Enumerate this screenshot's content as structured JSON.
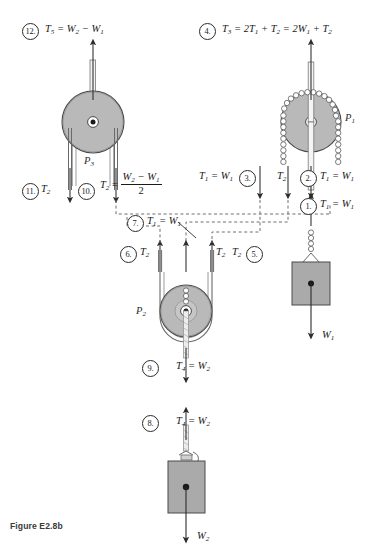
{
  "figure": {
    "caption": "Figure E2.8b"
  },
  "pulleys": [
    {
      "id": "p1",
      "label_base": "P",
      "label_sub": "1",
      "x": 311,
      "y": 122,
      "r": 30
    },
    {
      "id": "p2",
      "label_base": "P",
      "label_sub": "2",
      "x": 186,
      "y": 311,
      "r": 26
    },
    {
      "id": "p3",
      "label_base": "P",
      "label_sub": "3",
      "x": 93,
      "y": 122,
      "r": 31
    }
  ],
  "weights": [
    {
      "id": "w1",
      "label_base": "W",
      "label_sub": "1",
      "x": 311,
      "y": 292
    },
    {
      "id": "w2",
      "label_base": "W",
      "label_sub": "2",
      "x": 186,
      "y": 483
    }
  ],
  "annotations": [
    {
      "n": "1.",
      "text_html": "T<sub>1</sub> = W<sub>1</sub>",
      "plain": "T1 = W1",
      "arrow": "up",
      "num_x": 300,
      "num_y": 198,
      "lbl_x": 320,
      "lbl_y": 199
    },
    {
      "n": "2.",
      "text_html": "T<sub>1</sub> = W<sub>1</sub>",
      "plain": "T1 = W1",
      "arrow": "down",
      "num_x": 300,
      "num_y": 170,
      "lbl_x": 320,
      "lbl_y": 171
    },
    {
      "n": "3.",
      "text_html": "T<sub>1</sub> = W<sub>1</sub>",
      "plain": "T1 = W1",
      "arrow": "down",
      "num_x": 239,
      "num_y": 170,
      "lbl_x": 199,
      "lbl_y": 171
    },
    {
      "n": "4.",
      "text_html": "T<sub>3</sub> = 2T<sub>1</sub> + T<sub>2</sub> = 2W<sub>1</sub> + T<sub>2</sub>",
      "plain": "T3 = 2T1 + T2 = 2W1 + T2",
      "arrow": "up",
      "num_x": 199,
      "num_y": 23,
      "lbl_x": 222,
      "lbl_y": 24
    },
    {
      "n": "5.",
      "text_html": "T<sub>2</sub>",
      "plain": "T2",
      "arrow": "up",
      "num_x": 246,
      "num_y": 246,
      "lbl_x": 232,
      "lbl_y": 247
    },
    {
      "n": "6.",
      "text_html": "T<sub>2</sub>",
      "plain": "T2",
      "arrow": "up",
      "num_x": 120,
      "num_y": 246,
      "lbl_x": 140,
      "lbl_y": 247
    },
    {
      "n": "7.",
      "text_html": "T<sub>1</sub> = W<sub>1</sub>",
      "plain": "T1 = W1",
      "arrow": "none",
      "num_x": 127,
      "num_y": 215,
      "lbl_x": 147,
      "lbl_y": 216
    },
    {
      "n": "8.",
      "text_html": "T<sub>4</sub> = W<sub>2</sub>",
      "plain": "T4 = W2",
      "arrow": "up",
      "num_x": 142,
      "num_y": 415,
      "lbl_x": 176,
      "lbl_y": 416
    },
    {
      "n": "9.",
      "text_html": "T<sub>4</sub> = W<sub>2</sub>",
      "plain": "T4 = W2",
      "arrow": "down",
      "num_x": 142,
      "num_y": 360,
      "lbl_x": 176,
      "lbl_y": 361
    },
    {
      "n": "10.",
      "text_html": "FRACTION",
      "plain": "T2 = (W2 - W1)/2",
      "arrow": "down",
      "num_x": 78,
      "num_y": 183,
      "lbl_x": 111,
      "lbl_y": 176
    },
    {
      "n": "11.",
      "text_html": "T<sub>2</sub>",
      "plain": "T2",
      "arrow": "down",
      "num_x": 22,
      "num_y": 183,
      "lbl_x": 41,
      "lbl_y": 184
    },
    {
      "n": "12.",
      "text_html": "T<sub>5</sub> = W<sub>2</sub> &minus; W<sub>1</sub>",
      "plain": "T5 = W2 - W1",
      "arrow": "up",
      "num_x": 22,
      "num_y": 23,
      "lbl_x": 45,
      "lbl_y": 24
    }
  ],
  "fraction_10": {
    "lhs_base": "T",
    "lhs_sub": "2",
    "eq": "=",
    "numerator_html": "W<sub>2</sub> &minus; W<sub>1</sub>",
    "denominator": "2"
  },
  "inline_labels": [
    {
      "id": "t2-p1-left",
      "text_html": "T<sub>2</sub>",
      "plain": "T2",
      "x": 277,
      "y": 171
    },
    {
      "id": "t2-p2-right",
      "text_html": "T<sub>2</sub>",
      "plain": "T2",
      "x": 216,
      "y": 247
    },
    {
      "id": "w1-weight",
      "text_html": "W<sub>1</sub>",
      "plain": "W1",
      "x": 322,
      "y": 337
    },
    {
      "id": "w2-weight",
      "text_html": "W<sub>2</sub>",
      "plain": "W2",
      "x": 197,
      "y": 538
    }
  ],
  "colors": {
    "pulley_fill": "#b9b9b9",
    "pulley_stroke": "#4a4a4a",
    "block_fill": "#aaaaaa",
    "block_stroke": "#4a4a4a",
    "line": "#2b2b2b",
    "dashed": "#6e6e6e",
    "background": "#ffffff"
  }
}
